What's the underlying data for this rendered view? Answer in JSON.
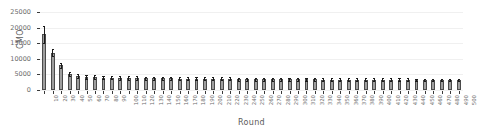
{
  "chart_data": {
    "type": "bar",
    "title": "",
    "xlabel": "Round",
    "ylabel": "CMO",
    "ylim": [
      0,
      25000
    ],
    "yticks": [
      0,
      5000,
      10000,
      15000,
      20000,
      25000
    ],
    "ytick_labels": [
      "0",
      "5000",
      "10000",
      "15000",
      "20000",
      "25000"
    ],
    "grid": true,
    "grid_axis": "y",
    "legend": "none",
    "error_bars": true,
    "bar_color": "#9e9e9e",
    "bar_edge_color": "#4a4a4a",
    "error_color": "#1a1a1a",
    "categories": [
      "10",
      "20",
      "30",
      "40",
      "50",
      "60",
      "70",
      "80",
      "90",
      "100",
      "110",
      "120",
      "130",
      "140",
      "150",
      "160",
      "170",
      "180",
      "190",
      "200",
      "210",
      "220",
      "230",
      "240",
      "250",
      "260",
      "270",
      "280",
      "290",
      "300",
      "310",
      "320",
      "330",
      "340",
      "350",
      "360",
      "370",
      "380",
      "390",
      "400",
      "410",
      "420",
      "430",
      "440",
      "450",
      "460",
      "470",
      "480",
      "490",
      "500"
    ],
    "values": [
      17800,
      11900,
      8000,
      5100,
      4500,
      4200,
      4100,
      4000,
      3950,
      3900,
      3850,
      3800,
      3780,
      3750,
      3720,
      3700,
      3680,
      3650,
      3630,
      3600,
      3580,
      3560,
      3540,
      3520,
      3500,
      3480,
      3470,
      3450,
      3430,
      3420,
      3400,
      3390,
      3380,
      3360,
      3350,
      3340,
      3330,
      3320,
      3310,
      3300,
      3290,
      3280,
      3270,
      3260,
      3250,
      3240,
      3230,
      3220,
      3210,
      3200
    ],
    "errors": [
      2700,
      1100,
      800,
      650,
      600,
      580,
      570,
      560,
      550,
      545,
      540,
      535,
      530,
      525,
      520,
      515,
      510,
      505,
      500,
      495,
      490,
      488,
      485,
      482,
      480,
      478,
      475,
      472,
      470,
      468,
      465,
      462,
      460,
      458,
      455,
      452,
      450,
      448,
      445,
      442,
      440,
      438,
      435,
      432,
      430,
      428,
      425,
      422,
      420,
      418
    ]
  }
}
